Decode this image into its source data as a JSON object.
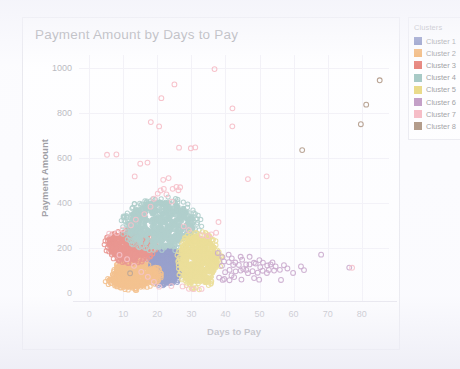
{
  "card": {
    "title": "Payment Amount by Days to Pay"
  },
  "legend": {
    "title": "Clusters",
    "items": [
      {
        "label": "Cluster 1",
        "color": "#3b4b9c"
      },
      {
        "label": "Cluster 2",
        "color": "#ed8b23"
      },
      {
        "label": "Cluster 3",
        "color": "#d93a2b"
      },
      {
        "label": "Cluster 4",
        "color": "#6fa8a0"
      },
      {
        "label": "Cluster 5",
        "color": "#ddc43a"
      },
      {
        "label": "Cluster 6",
        "color": "#9c5fa0"
      },
      {
        "label": "Cluster 7",
        "color": "#f2909f"
      },
      {
        "label": "Cluster 8",
        "color": "#7d5535"
      }
    ]
  },
  "chart_data": {
    "type": "scatter",
    "title": "Payment Amount by Days to Pay",
    "xlabel": "Days to Pay",
    "ylabel": "Payment Amount",
    "xlim": [
      -3,
      88
    ],
    "ylim": [
      -40,
      1060
    ],
    "xticks": [
      0,
      10,
      20,
      30,
      40,
      50,
      60,
      70,
      80
    ],
    "yticks": [
      0,
      200,
      400,
      600,
      800,
      1000
    ],
    "grid": true,
    "legend_position": "right",
    "marker": "open-circle",
    "series": [
      {
        "name": "Cluster 1",
        "color": "#3b4b9c",
        "blob": {
          "cx": 22.5,
          "cy": 120,
          "rx": 4.6,
          "ry": 78,
          "n": 420,
          "shape": "wedge-lower-mid"
        }
      },
      {
        "name": "Cluster 2",
        "color": "#ed8b23",
        "blob": {
          "cx": 12.5,
          "cy": 85,
          "rx": 6.4,
          "ry": 72,
          "n": 430,
          "shape": "wedge-lower-left"
        }
      },
      {
        "name": "Cluster 3",
        "color": "#d93a2b",
        "blob": {
          "cx": 12.0,
          "cy": 210,
          "rx": 6.2,
          "ry": 62,
          "n": 360,
          "shape": "wedge-upper-left"
        }
      },
      {
        "name": "Cluster 4",
        "color": "#6fa8a0",
        "blob": {
          "cx": 21.0,
          "cy": 305,
          "rx": 8.5,
          "ry": 78,
          "n": 470,
          "shape": "wedge-top"
        }
      },
      {
        "name": "Cluster 5",
        "color": "#ddc43a",
        "blob": {
          "cx": 31.5,
          "cy": 145,
          "rx": 5.6,
          "ry": 108,
          "n": 450,
          "shape": "wedge-right"
        }
      },
      {
        "name": "Cluster 6",
        "color": "#9c5fa0",
        "comment": "sparse low-amount tail extending right",
        "points": [
          [
            38,
            180
          ],
          [
            39,
            160
          ],
          [
            39,
            120
          ],
          [
            40,
            140
          ],
          [
            40,
            95
          ],
          [
            41,
            170
          ],
          [
            41,
            130
          ],
          [
            41,
            105
          ],
          [
            42,
            150
          ],
          [
            42,
            118
          ],
          [
            42,
            80
          ],
          [
            43,
            135
          ],
          [
            43,
            100
          ],
          [
            44,
            160
          ],
          [
            44,
            122
          ],
          [
            44,
            88
          ],
          [
            45,
            145
          ],
          [
            45,
            110
          ],
          [
            46,
            130
          ],
          [
            46,
            98
          ],
          [
            47,
            155
          ],
          [
            47,
            120
          ],
          [
            47,
            85
          ],
          [
            48,
            140
          ],
          [
            48,
            105
          ],
          [
            49,
            128
          ],
          [
            49,
            95
          ],
          [
            50,
            150
          ],
          [
            50,
            112
          ],
          [
            51,
            135
          ],
          [
            51,
            100
          ],
          [
            52,
            120
          ],
          [
            52,
            88
          ],
          [
            53,
            130
          ],
          [
            53,
            105
          ],
          [
            54,
            140
          ],
          [
            54,
            95
          ],
          [
            55,
            118
          ],
          [
            56,
            102
          ],
          [
            56,
            58
          ],
          [
            57,
            125
          ],
          [
            58,
            110
          ],
          [
            60,
            95
          ],
          [
            62,
            120
          ],
          [
            63,
            100
          ],
          [
            68,
            172
          ],
          [
            76,
            108
          ],
          [
            38,
            70
          ],
          [
            39,
            62
          ],
          [
            40,
            65
          ],
          [
            41,
            55
          ],
          [
            43,
            72
          ],
          [
            45,
            60
          ],
          [
            48,
            68
          ],
          [
            50,
            62
          ]
        ]
      },
      {
        "name": "Cluster 7",
        "color": "#f2909f",
        "comment": "high-amount outliers scattered across low-mid days",
        "points": [
          [
            5,
            612
          ],
          [
            8,
            615
          ],
          [
            13,
            518
          ],
          [
            15,
            575
          ],
          [
            17,
            578
          ],
          [
            18,
            765
          ],
          [
            20,
            745
          ],
          [
            21,
            862
          ],
          [
            22,
            505
          ],
          [
            23,
            508
          ],
          [
            25,
            928
          ],
          [
            26,
            645
          ],
          [
            26,
            470
          ],
          [
            27,
            472
          ],
          [
            30,
            645
          ],
          [
            31,
            648
          ],
          [
            37,
            995
          ],
          [
            38,
            318
          ],
          [
            42,
            822
          ],
          [
            42,
            742
          ],
          [
            47,
            503
          ],
          [
            52,
            520
          ],
          [
            77,
            108
          ],
          [
            6,
            262
          ],
          [
            8,
            268
          ],
          [
            10,
            285
          ],
          [
            12,
            300
          ],
          [
            14,
            330
          ],
          [
            16,
            355
          ],
          [
            18,
            380
          ],
          [
            19,
            420
          ],
          [
            20,
            440
          ],
          [
            21,
            455
          ],
          [
            22,
            462
          ],
          [
            23,
            440
          ],
          [
            24,
            410
          ],
          [
            25,
            465
          ],
          [
            26,
            455
          ],
          [
            28,
            300
          ],
          [
            29,
            280
          ],
          [
            33,
            262
          ],
          [
            35,
            255
          ],
          [
            36,
            258
          ],
          [
            37,
            262
          ],
          [
            9,
            175
          ],
          [
            11,
            150
          ],
          [
            13,
            120
          ],
          [
            15,
            95
          ],
          [
            17,
            70
          ],
          [
            19,
            48
          ],
          [
            21,
            35
          ],
          [
            24,
            30
          ],
          [
            27,
            25
          ],
          [
            29,
            20
          ],
          [
            31,
            22
          ],
          [
            33,
            18
          ]
        ]
      },
      {
        "name": "Cluster 8",
        "color": "#7d5535",
        "comment": "few isolated markers",
        "points": [
          [
            12,
            88
          ],
          [
            62,
            638
          ],
          [
            80,
            750
          ],
          [
            81,
            842
          ],
          [
            85,
            948
          ]
        ]
      }
    ]
  }
}
